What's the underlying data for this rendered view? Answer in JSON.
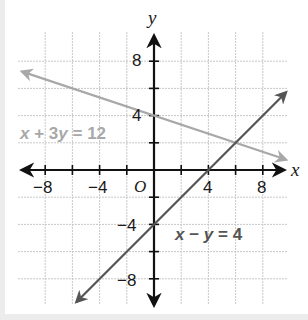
{
  "chart_data": {
    "type": "line",
    "title": "",
    "xlabel": "x",
    "ylabel": "y",
    "origin_label": "O",
    "xlim": [
      -10,
      10
    ],
    "ylim": [
      -10,
      10
    ],
    "grid": true,
    "grid_step": 2,
    "x_ticks": [
      -8,
      -4,
      4,
      8
    ],
    "y_ticks": [
      8,
      4,
      -4,
      -8
    ],
    "x_tick_labels": [
      "−8",
      "−4",
      "4",
      "8"
    ],
    "y_tick_labels": [
      "8",
      "4",
      "−4",
      "−8"
    ],
    "series": [
      {
        "name": "x + 3y = 12",
        "label_parts": [
          "x",
          " + 3",
          "y",
          " = 12"
        ],
        "equation": "x + 3y = 12",
        "slope": -0.3333,
        "intercept": 4,
        "x": [
          -10,
          -6,
          0,
          6,
          9
        ],
        "y": [
          7.33,
          6,
          4,
          2,
          1
        ],
        "color": "#a8a8a8"
      },
      {
        "name": "x − y = 4",
        "label_parts": [
          "x",
          " − ",
          "y",
          " = 4"
        ],
        "equation": "x - y = 4",
        "slope": 1,
        "intercept": -4,
        "x": [
          -5.5,
          0,
          4,
          6,
          9.5
        ],
        "y": [
          -9.5,
          -4,
          0,
          2,
          5.5
        ],
        "color": "#555555"
      }
    ],
    "intersection": {
      "x": 6,
      "y": 2
    },
    "legend": "none (inline labels)"
  }
}
